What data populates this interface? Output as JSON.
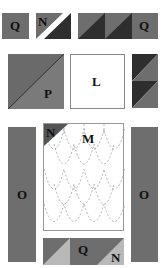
{
  "colors": {
    "medium_gray": "#6e6e6e",
    "dark_gray": "#2e2e2e",
    "light_gray": "#b9b9b9",
    "white": "#ffffff",
    "dashed_line": "#9a9a9a"
  },
  "pieces": {
    "top_q_left": {
      "label": "Q"
    },
    "top_n_block": {
      "label": "N"
    },
    "top_right_q": {
      "label": "Q"
    },
    "p_block": {
      "label": "P"
    },
    "l_block": {
      "label": "L"
    },
    "o_left": {
      "label": "O"
    },
    "o_right": {
      "label": "O"
    },
    "m_panel": {
      "label": "M",
      "corner_label": "N"
    },
    "bottom_q": {
      "label": "Q"
    },
    "bottom_n": {
      "label": "N"
    }
  }
}
